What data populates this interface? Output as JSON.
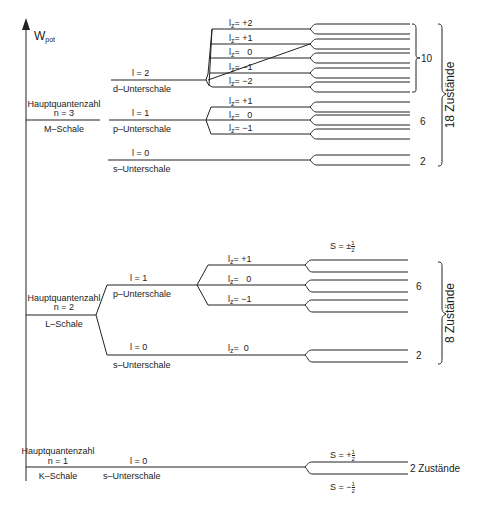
{
  "axis": {
    "label": "W",
    "label_sub": "pot"
  },
  "shells": {
    "M": {
      "title": "Hauptquantenzahl",
      "n": "n = 3",
      "name": "M–Schale",
      "subshells": {
        "d": {
          "l": "l = 2",
          "name": "d–Unterschale",
          "lz": [
            "+2",
            "+1",
            "0",
            "−1",
            "−2"
          ],
          "count": "10"
        },
        "p": {
          "l": "l = 1",
          "name": "p–Unterschale",
          "lz": [
            "+1",
            "0",
            "−1"
          ],
          "count": "6"
        },
        "s": {
          "l": "l = 0",
          "name": "s–Unterschale",
          "count": "2"
        }
      },
      "total": "18 Zustände"
    },
    "L": {
      "title": "Hauptquantenzahl",
      "n": "n = 2",
      "name": "L–Schale",
      "spin_label": "S = ±",
      "subshells": {
        "p": {
          "l": "l = 1",
          "name": "p–Unterschale",
          "lz": [
            "+1",
            "0",
            "−1"
          ],
          "count": "6"
        },
        "s": {
          "l": "l = 0",
          "name": "s–Unterschale",
          "lz": [
            "0"
          ],
          "count": "2"
        }
      },
      "total": "8 Zustände"
    },
    "K": {
      "title": "Hauptquantenzahl",
      "n": "n = 1",
      "name": "K–Schale",
      "subshells": {
        "s": {
          "l": "l = 0",
          "name": "s–Unterschale"
        }
      },
      "spin_up": "S = +",
      "spin_down": "S = −",
      "total": "2 Zustände"
    }
  },
  "lz_prefix": "l",
  "lz_sub": "z",
  "lz_eq": "= ",
  "half_num": "1",
  "half_den": "2"
}
